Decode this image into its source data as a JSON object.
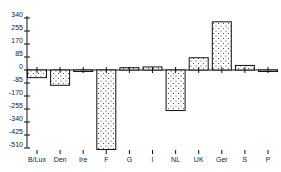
{
  "chart_data": {
    "type": "bar",
    "title": "",
    "xlabel": "",
    "ylabel": "",
    "categories": [
      "B/Lux",
      "Den",
      "Ire",
      "F",
      "G",
      "I",
      "NL",
      "UK",
      "Ger",
      "S",
      "P"
    ],
    "values": [
      -50,
      -100,
      -10,
      -520,
      15,
      20,
      -265,
      80,
      315,
      30,
      -10
    ],
    "yticks": [
      340,
      255,
      170,
      85,
      0,
      -85,
      -170,
      -255,
      -340,
      -425,
      -510
    ],
    "ylim": [
      -510,
      340
    ],
    "grid": false,
    "legend": null,
    "bar_fill": "dotted stipple pattern",
    "colors": {
      "bar_fill": "#ffffff",
      "bar_dots": "#333333",
      "bar_edge": "#111111",
      "axis": "#111111"
    }
  }
}
